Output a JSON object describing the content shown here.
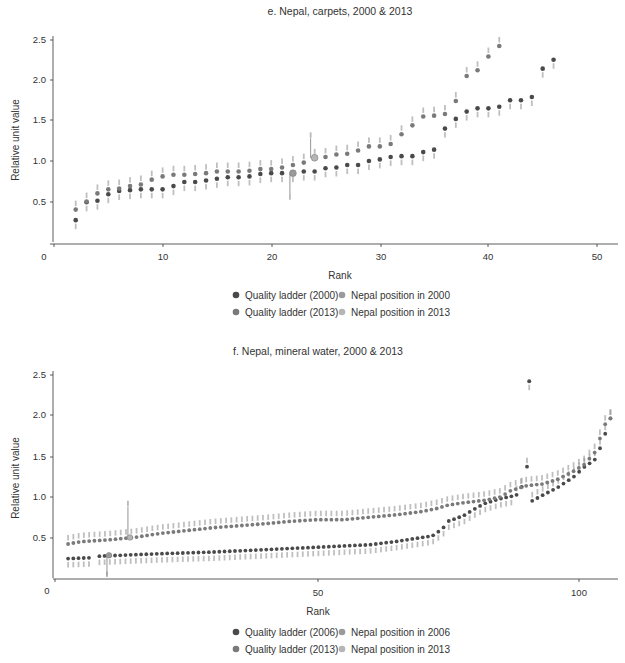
{
  "colors": {
    "ladder_early": "#4a4a4a",
    "ladder_2013": "#7a7a7a",
    "nepal_early": "#9a9a9a",
    "nepal_2013": "#b5b5b5",
    "axis": "#333333",
    "label": "#8a8a8a"
  },
  "chart_data": [
    {
      "type": "scatter",
      "title": "e. Nepal, carpets, 2000 & 2013",
      "xlabel": "Rank",
      "ylabel": "Relative unit value",
      "xlim": [
        0,
        52
      ],
      "ylim": [
        0,
        2.55
      ],
      "xticks": [
        "0",
        "10",
        "20",
        "30",
        "40",
        "50"
      ],
      "yticks": [
        "0.5",
        "1.0",
        "1.5",
        "2.0",
        "2.5"
      ],
      "grid": false,
      "legend_position": "bottom",
      "legend": [
        "Quality ladder (2000)",
        "Nepal position in 2000",
        "Quality ladder (2013)",
        "Nepal position in 2013"
      ],
      "series": [
        {
          "name": "Quality ladder (2000)",
          "x": [
            2,
            3,
            4,
            5,
            6,
            7,
            8,
            9,
            10,
            11,
            12,
            13,
            14,
            15,
            16,
            17,
            18,
            19,
            20,
            21,
            22,
            23,
            24,
            25,
            26,
            27,
            28,
            29,
            30,
            31,
            32,
            33,
            34,
            35,
            36,
            37,
            38,
            39,
            40,
            41,
            42,
            43,
            44,
            45,
            46
          ],
          "y": [
            0.27,
            0.49,
            0.51,
            0.59,
            0.63,
            0.64,
            0.65,
            0.65,
            0.65,
            0.69,
            0.74,
            0.74,
            0.76,
            0.78,
            0.8,
            0.8,
            0.81,
            0.84,
            0.85,
            0.85,
            0.85,
            0.87,
            0.87,
            0.91,
            0.92,
            0.95,
            0.95,
            1.0,
            1.02,
            1.05,
            1.06,
            1.06,
            1.11,
            1.14,
            1.4,
            1.52,
            1.61,
            1.65,
            1.65,
            1.67,
            1.75,
            1.75,
            1.79,
            2.14,
            2.25
          ]
        },
        {
          "name": "Quality ladder (2013)",
          "x": [
            2,
            3,
            4,
            5,
            6,
            7,
            8,
            9,
            10,
            11,
            12,
            13,
            14,
            15,
            16,
            17,
            18,
            19,
            20,
            21,
            22,
            23,
            24,
            25,
            26,
            27,
            28,
            29,
            30,
            31,
            32,
            33,
            34,
            35,
            36,
            37,
            38,
            39,
            40,
            41
          ],
          "y": [
            0.4,
            0.5,
            0.6,
            0.65,
            0.66,
            0.69,
            0.71,
            0.77,
            0.81,
            0.83,
            0.83,
            0.84,
            0.85,
            0.87,
            0.87,
            0.87,
            0.88,
            0.9,
            0.9,
            0.92,
            0.95,
            0.98,
            1.04,
            1.05,
            1.08,
            1.09,
            1.13,
            1.18,
            1.18,
            1.21,
            1.33,
            1.44,
            1.55,
            1.56,
            1.58,
            1.74,
            2.05,
            2.12,
            2.29,
            2.42
          ]
        }
      ],
      "nepal": [
        {
          "name": "Nepal position in 2000",
          "x": 22,
          "y": 0.85,
          "line_to": 0.59
        },
        {
          "name": "Nepal position in 2013",
          "x": 24,
          "y": 1.04,
          "line_to": 1.28
        }
      ]
    },
    {
      "type": "scatter",
      "title": "f. Nepal, mineral water, 2000 & 2013",
      "xlabel": "Rank",
      "ylabel": "Relative unit value",
      "xlim": [
        0,
        108
      ],
      "ylim": [
        0,
        2.55
      ],
      "xticks": [
        "0",
        "50",
        "100"
      ],
      "yticks": [
        "0.5",
        "1.0",
        "1.5",
        "2.0",
        "2.5"
      ],
      "grid": false,
      "legend_position": "bottom",
      "legend": [
        "Quality ladder (2006)",
        "Nepal position in 2006",
        "Quality ladder (2013)",
        "Nepal position in 2013"
      ],
      "series": [
        {
          "name": "Quality ladder (2006)",
          "x_start": 2.5,
          "anchors": [
            [
              2.5,
              0.24
            ],
            [
              7,
              0.25
            ],
            [
              8.5,
              0.27
            ],
            [
              20,
              0.3
            ],
            [
              30,
              0.32
            ],
            [
              40,
              0.35
            ],
            [
              50,
              0.38
            ],
            [
              60,
              0.41
            ],
            [
              65,
              0.45
            ],
            [
              70,
              0.5
            ],
            [
              72,
              0.52
            ],
            [
              74,
              0.61
            ],
            [
              75,
              0.7
            ],
            [
              78,
              0.77
            ],
            [
              80,
              0.85
            ],
            [
              82,
              0.92
            ],
            [
              85,
              0.98
            ],
            [
              88,
              1.02
            ],
            [
              89,
              1.1
            ],
            [
              90,
              1.41
            ],
            [
              91,
              0.95
            ],
            [
              93,
              1.02
            ],
            [
              96,
              1.12
            ],
            [
              99,
              1.25
            ],
            [
              101,
              1.37
            ],
            [
              103,
              1.46
            ],
            [
              104,
              1.6
            ],
            [
              105,
              1.78
            ],
            [
              106,
              1.97
            ]
          ],
          "count": 105,
          "gap": [
            7.2,
            8.4
          ],
          "outlier": {
            "x": 90.5,
            "y": 2.43
          }
        },
        {
          "name": "Quality ladder (2013)",
          "anchors": [
            [
              2.5,
              0.42
            ],
            [
              5,
              0.45
            ],
            [
              10,
              0.47
            ],
            [
              15,
              0.5
            ],
            [
              20,
              0.55
            ],
            [
              30,
              0.62
            ],
            [
              40,
              0.67
            ],
            [
              45,
              0.7
            ],
            [
              50,
              0.72
            ],
            [
              55,
              0.72
            ],
            [
              60,
              0.75
            ],
            [
              65,
              0.78
            ],
            [
              70,
              0.82
            ],
            [
              73,
              0.86
            ],
            [
              75,
              0.9
            ],
            [
              78,
              0.93
            ],
            [
              82,
              0.96
            ],
            [
              85,
              1.0
            ],
            [
              87,
              1.08
            ],
            [
              89,
              1.12
            ],
            [
              90,
              1.14
            ],
            [
              93,
              1.16
            ],
            [
              96,
              1.22
            ],
            [
              99,
              1.32
            ],
            [
              101,
              1.4
            ],
            [
              103,
              1.55
            ],
            [
              105,
              1.9
            ],
            [
              106,
              1.97
            ]
          ],
          "count": 104
        }
      ],
      "nepal": [
        {
          "name": "Nepal position in 2006",
          "x": 10.3,
          "y": 0.28,
          "line_to": 0.03
        },
        {
          "name": "Nepal position in 2013",
          "x": 14.3,
          "y": 0.5,
          "line_to": 0.88
        }
      ]
    }
  ],
  "charts": {
    "e": {
      "title": "e. Nepal, carpets, 2000 & 2013",
      "ylabel": "Relative unit value",
      "xlabel": "Rank",
      "legend": {
        "ladder_early": "Quality ladder (2000)",
        "nepal_early": "Nepal position in 2000",
        "ladder_2013": "Quality ladder (2013)",
        "nepal_2013": "Nepal position in 2013"
      }
    },
    "f": {
      "title": "f. Nepal, mineral water, 2000 & 2013",
      "ylabel": "Relative unit value",
      "xlabel": "Rank",
      "legend": {
        "ladder_early": "Quality ladder (2006)",
        "nepal_early": "Nepal position in 2006",
        "ladder_2013": "Quality ladder (2013)",
        "nepal_2013": "Nepal position in 2013"
      }
    }
  }
}
